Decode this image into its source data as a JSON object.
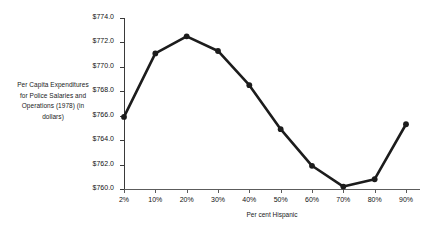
{
  "chart_data": {
    "type": "line",
    "title": "",
    "xlabel": "Per cent Hispanic",
    "ylabel": "Per Capita Expenditures for Police Salaries and Operations (1978) (in dollars)",
    "ylabel_lines": [
      "Per Capita Expenditures",
      "for Police Salaries and",
      "Operations (1978) (in",
      "dollars)"
    ],
    "categories": [
      "2%",
      "10%",
      "20%",
      "30%",
      "40%",
      "50%",
      "60%",
      "70%",
      "80%",
      "90%"
    ],
    "values": [
      765.9,
      771.1,
      772.5,
      771.3,
      768.5,
      764.9,
      761.9,
      760.2,
      760.8,
      765.3
    ],
    "ytick_labels": [
      "$774.0",
      "$772.0",
      "$770.0",
      "$768.0",
      "$766.0",
      "$764.0",
      "$762.0",
      "$760.0"
    ],
    "ytick_values": [
      774.0,
      772.0,
      770.0,
      768.0,
      766.0,
      764.0,
      762.0,
      760.0
    ],
    "ylim": [
      760.0,
      774.0
    ],
    "grid": false,
    "legend": false,
    "series_color": "#1c1c1c",
    "marker": "circle",
    "axis_color": "#3a3a3a"
  }
}
